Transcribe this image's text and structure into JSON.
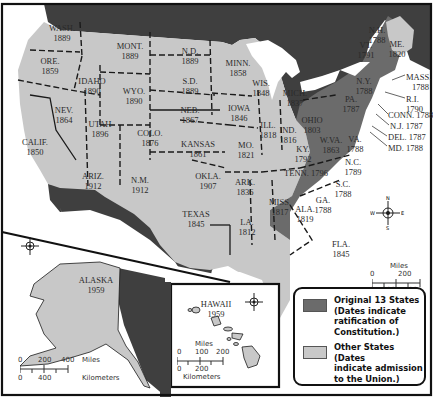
{
  "colors": {
    "original_13": "#6b6b6b",
    "other_states": "#c8c8c8",
    "foreign": "#3f3f3f",
    "water": "#ffffff",
    "border": "#111111"
  },
  "states": [
    {
      "abbr": "WASH.",
      "year": "1889"
    },
    {
      "abbr": "ORE.",
      "year": "1859"
    },
    {
      "abbr": "CALIF.",
      "year": "1850"
    },
    {
      "abbr": "IDAHO",
      "year": "1890"
    },
    {
      "abbr": "NEV.",
      "year": "1864"
    },
    {
      "abbr": "MONT.",
      "year": "1889"
    },
    {
      "abbr": "WYO.",
      "year": "1890"
    },
    {
      "abbr": "UTAH",
      "year": "1896"
    },
    {
      "abbr": "ARIZ.",
      "year": "1912"
    },
    {
      "abbr": "COLO.",
      "year": "1876"
    },
    {
      "abbr": "N.M.",
      "year": "1912"
    },
    {
      "abbr": "N.D.",
      "year": "1889"
    },
    {
      "abbr": "S.D.",
      "year": "1889"
    },
    {
      "abbr": "NEB.",
      "year": "1867"
    },
    {
      "abbr": "KANSAS",
      "year": "1861"
    },
    {
      "abbr": "OKLA.",
      "year": "1907"
    },
    {
      "abbr": "TEXAS",
      "year": "1845"
    },
    {
      "abbr": "MINN.",
      "year": "1858"
    },
    {
      "abbr": "IOWA",
      "year": "1846"
    },
    {
      "abbr": "MO.",
      "year": "1821"
    },
    {
      "abbr": "ARK.",
      "year": "1836"
    },
    {
      "abbr": "LA.",
      "year": "1812"
    },
    {
      "abbr": "WIS.",
      "year": "1848"
    },
    {
      "abbr": "ILL.",
      "year": "1818"
    },
    {
      "abbr": "MICH.",
      "year": "1837"
    },
    {
      "abbr": "IND.",
      "year": "1816"
    },
    {
      "abbr": "OHIO",
      "year": "1803"
    },
    {
      "abbr": "KY.",
      "year": "1792"
    },
    {
      "abbr": "TENN.",
      "year": "1796"
    },
    {
      "abbr": "MISS.",
      "year": "1817"
    },
    {
      "abbr": "ALA.",
      "year": "1819"
    },
    {
      "abbr": "W.VA.",
      "year": "1863"
    },
    {
      "abbr": "FLA.",
      "year": "1845"
    },
    {
      "abbr": "GA.",
      "year": "1788"
    },
    {
      "abbr": "S.C.",
      "year": "1788"
    },
    {
      "abbr": "N.C.",
      "year": "1789"
    },
    {
      "abbr": "VA.",
      "year": "1788"
    },
    {
      "abbr": "PA.",
      "year": "1787"
    },
    {
      "abbr": "N.Y.",
      "year": "1788"
    },
    {
      "abbr": "VT.",
      "year": "1791"
    },
    {
      "abbr": "N.H.",
      "year": "1788"
    },
    {
      "abbr": "ME.",
      "year": "1820"
    },
    {
      "abbr": "ALASKA",
      "year": "1959"
    },
    {
      "abbr": "HAWAII",
      "year": "1959"
    }
  ],
  "callouts": {
    "mass": "MASS.",
    "mass_year": "1788",
    "ri": "R.I.",
    "ri_year": "1790",
    "conn": "CONN. 1788",
    "nj": "N.J. 1787",
    "del": "DEL. 1787",
    "md": "MD. 1788"
  },
  "scales": {
    "main": {
      "miles_label": "Miles",
      "miles_ticks": [
        "0",
        "200"
      ],
      "km_ticks": [
        "0",
        "200",
        "400"
      ],
      "km_label": "Kilometers"
    },
    "alaska": {
      "miles_ticks": [
        "0",
        "200",
        "400"
      ],
      "miles_label": "Miles",
      "km_ticks": [
        "0",
        "400"
      ],
      "km_label": "Kilometers"
    },
    "hawaii": {
      "miles_label": "Miles",
      "miles_ticks": [
        "0",
        "100",
        "200"
      ],
      "km_ticks": [
        "0",
        "200"
      ],
      "km_label": "Kilometers"
    }
  },
  "compass": {
    "n": "N",
    "s": "S",
    "e": "E",
    "w": "W"
  },
  "legend": {
    "items": [
      {
        "label_lines": [
          "Original 13 States",
          "(Dates indicate",
          "ratification of",
          "Constitution.)"
        ],
        "color": "#6b6b6b"
      },
      {
        "label_lines": [
          "Other States (Dates",
          "indicate admission",
          "to the Union.)"
        ],
        "color": "#c8c8c8"
      }
    ]
  }
}
